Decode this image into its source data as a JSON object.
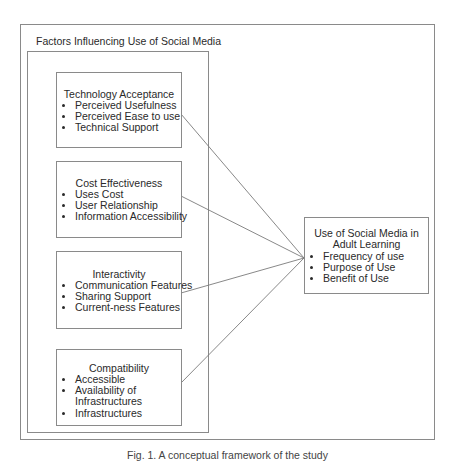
{
  "diagram": {
    "outer_title": "Factors Influencing Use of Social Media",
    "factors": [
      {
        "title": "Technology Acceptance",
        "items": [
          "Perceived Usefulness",
          "Perceived Ease to use",
          "Technical Support"
        ]
      },
      {
        "title": "Cost Effectiveness",
        "items": [
          "Uses Cost",
          "User Relationship",
          "Information Accessibility"
        ]
      },
      {
        "title": "Interactivity",
        "items": [
          "Communication Features",
          "Sharing Support",
          "Current-ness Features"
        ]
      },
      {
        "title": "Compatibility",
        "items": [
          "Accessible",
          "Availability of Infrastructures",
          "Infrastructures"
        ]
      }
    ],
    "outcome": {
      "title": "Use of Social Media in Adult Learning",
      "items": [
        "Frequency of use",
        "Purpose of Use",
        "Benefit of Use"
      ]
    },
    "caption": "Fig. 1. A conceptual framework of the study",
    "line_color": "#7a7a7a",
    "border_color": "#8a8a8a"
  }
}
